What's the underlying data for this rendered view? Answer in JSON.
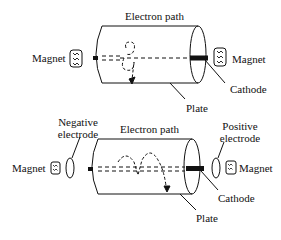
{
  "top_diagram": {
    "labels": {
      "electron_path": "Electron path",
      "magnet_left": "Magnet",
      "magnet_right": "Magnet",
      "cathode": "Cathode",
      "plate": "Plate"
    }
  },
  "bottom_diagram": {
    "labels": {
      "negative_electrode_line1": "Negative",
      "negative_electrode_line2": "electrode",
      "electron_path": "Electron path",
      "positive_electrode_line1": "Positive",
      "positive_electrode_line2": "electrode",
      "magnet_left": "Magnet",
      "magnet_right": "Magnet",
      "cathode": "Cathode",
      "plate": "Plate"
    }
  },
  "colors": {
    "ink": "#111111",
    "background": "#ffffff"
  }
}
